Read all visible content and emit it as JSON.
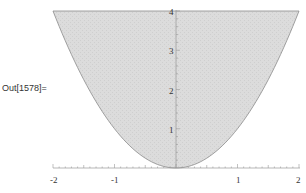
{
  "cell": {
    "output_label": "Out[1578]="
  },
  "chart_data": {
    "type": "area",
    "title": "",
    "function": "y = x^2 (region above parabola, below y = 4)",
    "xlabel": "",
    "ylabel": "",
    "xlim": [
      -2,
      2
    ],
    "ylim": [
      0,
      4
    ],
    "x_ticks": [
      "-2",
      "-1",
      "1",
      "2"
    ],
    "y_ticks": [
      "1",
      "2",
      "3",
      "4"
    ],
    "x": [
      -2,
      -1.5,
      -1,
      -0.5,
      0,
      0.5,
      1,
      1.5,
      2
    ],
    "series": [
      {
        "name": "lower boundary y=x^2",
        "values": [
          4,
          2.25,
          1,
          0.25,
          0,
          0.25,
          1,
          2.25,
          4
        ]
      },
      {
        "name": "upper boundary y=4",
        "values": [
          4,
          4,
          4,
          4,
          4,
          4,
          4,
          4,
          4
        ]
      }
    ],
    "grid": false,
    "legend": "none",
    "fill_color": "#d9d9d9",
    "edge_color": "#888888"
  }
}
